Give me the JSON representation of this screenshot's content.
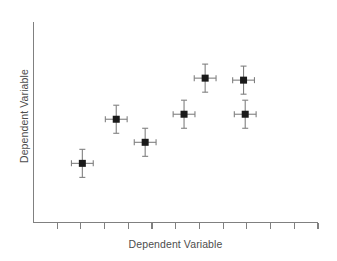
{
  "figure": {
    "background_color": "#ffffff",
    "axis_color": "#808080",
    "marker_color": "#1a1a1a",
    "errorbar_color": "#808080",
    "label_color": "#4d4d4d"
  },
  "chart_data": {
    "type": "scatter",
    "title": "",
    "xlabel": "Dependent Variable",
    "ylabel": "Dependent Variable",
    "grid": false,
    "legend": null,
    "xlim": [
      0,
      12
    ],
    "ylim": [
      0,
      10
    ],
    "xticks": [
      1,
      2,
      3,
      4,
      5,
      6,
      7,
      8,
      9,
      10,
      11,
      12
    ],
    "xticklabels": [
      "",
      "",
      "",
      "",
      "",
      "",
      "",
      "",
      "",
      "",
      "",
      ""
    ],
    "yticks": [],
    "yticklabels": [],
    "marker": "square",
    "marker_size": 7,
    "points": [
      {
        "x": 2.06,
        "y": 2.95,
        "xerr": 0.46,
        "yerr": 0.7
      },
      {
        "x": 3.49,
        "y": 5.15,
        "xerr": 0.46,
        "yerr": 0.7
      },
      {
        "x": 4.71,
        "y": 4.0,
        "xerr": 0.46,
        "yerr": 0.7
      },
      {
        "x": 6.35,
        "y": 5.4,
        "xerr": 0.46,
        "yerr": 0.7
      },
      {
        "x": 7.24,
        "y": 7.2,
        "xerr": 0.46,
        "yerr": 0.7
      },
      {
        "x": 8.86,
        "y": 7.1,
        "xerr": 0.46,
        "yerr": 0.7
      },
      {
        "x": 8.93,
        "y": 5.4,
        "xerr": 0.46,
        "yerr": 0.7
      }
    ]
  }
}
